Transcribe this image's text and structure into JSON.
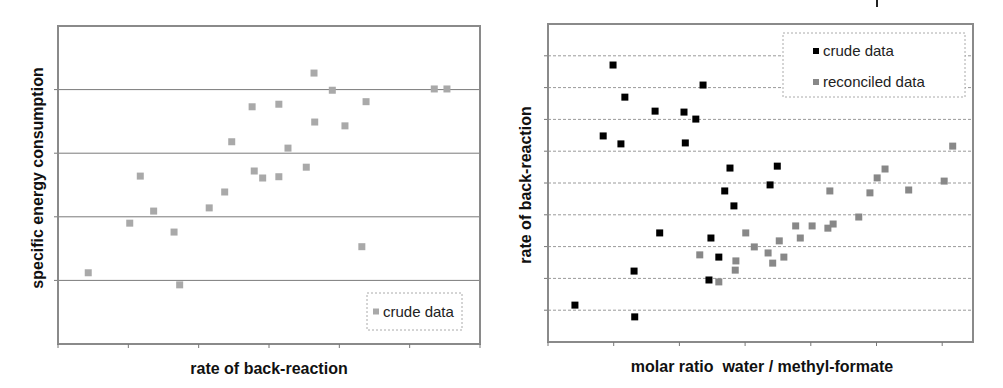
{
  "chart_data": [
    {
      "type": "scatter",
      "title": "",
      "xlabel": "rate of back-reaction",
      "ylabel": "specific energy consumption",
      "xlim": [
        0,
        6
      ],
      "ylim": [
        0,
        5
      ],
      "x_ticks_count": 6,
      "grid": {
        "y": true,
        "y_lines": [
          1,
          2,
          3,
          4
        ],
        "style": "solid"
      },
      "tick_labels_shown": false,
      "legend": {
        "position": "lower right",
        "entries": [
          "crude data"
        ]
      },
      "series": [
        {
          "name": "crude data",
          "color": "#a9a9a9",
          "points": [
            [
              0.43,
              1.12
            ],
            [
              1.02,
              1.9
            ],
            [
              1.17,
              2.64
            ],
            [
              1.36,
              2.09
            ],
            [
              1.65,
              1.76
            ],
            [
              1.73,
              0.93
            ],
            [
              2.15,
              2.14
            ],
            [
              2.37,
              2.39
            ],
            [
              2.47,
              3.18
            ],
            [
              2.76,
              3.73
            ],
            [
              2.79,
              2.72
            ],
            [
              2.91,
              2.61
            ],
            [
              3.14,
              2.63
            ],
            [
              3.14,
              3.77
            ],
            [
              3.27,
              3.08
            ],
            [
              3.53,
              2.78
            ],
            [
              3.64,
              4.26
            ],
            [
              3.65,
              3.49
            ],
            [
              3.9,
              3.99
            ],
            [
              4.08,
              3.43
            ],
            [
              4.38,
              3.81
            ],
            [
              4.32,
              1.53
            ],
            [
              5.35,
              4.01
            ],
            [
              5.53,
              4.01
            ]
          ]
        }
      ]
    },
    {
      "type": "scatter",
      "title": "",
      "xlabel": "molar ratio  water / methyl-formate",
      "ylabel": "rate of back-reaction",
      "xlim": [
        0,
        6.45
      ],
      "ylim": [
        0,
        10
      ],
      "x_ticks_count": 6,
      "grid": {
        "y": true,
        "y_lines": [
          1,
          2,
          3,
          4,
          5,
          6,
          7,
          8,
          9
        ],
        "style": "dashed"
      },
      "tick_labels_shown": false,
      "legend": {
        "position": "upper right",
        "entries": [
          "crude data",
          "reconciled data"
        ]
      },
      "series": [
        {
          "name": "crude data",
          "color": "#000000",
          "points": [
            [
              0.41,
              1.16
            ],
            [
              0.84,
              6.48
            ],
            [
              0.99,
              8.71
            ],
            [
              1.11,
              6.23
            ],
            [
              1.17,
              7.7
            ],
            [
              1.31,
              2.23
            ],
            [
              1.32,
              0.79
            ],
            [
              1.63,
              7.26
            ],
            [
              1.7,
              3.43
            ],
            [
              2.07,
              7.23
            ],
            [
              2.09,
              6.26
            ],
            [
              2.25,
              7.01
            ],
            [
              2.36,
              8.08
            ],
            [
              2.45,
              1.95
            ],
            [
              2.48,
              3.27
            ],
            [
              2.6,
              2.67
            ],
            [
              2.69,
              4.75
            ],
            [
              2.77,
              5.47
            ],
            [
              2.83,
              4.28
            ],
            [
              3.38,
              4.94
            ],
            [
              3.49,
              5.53
            ]
          ]
        },
        {
          "name": "reconciled data",
          "color": "#888888",
          "points": [
            [
              2.31,
              2.74
            ],
            [
              2.6,
              1.89
            ],
            [
              2.85,
              2.26
            ],
            [
              2.86,
              2.55
            ],
            [
              3.01,
              3.43
            ],
            [
              3.14,
              2.99
            ],
            [
              3.35,
              2.8
            ],
            [
              3.42,
              2.48
            ],
            [
              3.52,
              3.18
            ],
            [
              3.59,
              2.67
            ],
            [
              3.77,
              3.65
            ],
            [
              3.84,
              3.27
            ],
            [
              4.02,
              3.65
            ],
            [
              4.26,
              3.58
            ],
            [
              4.29,
              4.75
            ],
            [
              4.34,
              3.71
            ],
            [
              4.73,
              3.93
            ],
            [
              4.9,
              4.69
            ],
            [
              5.01,
              5.16
            ],
            [
              5.13,
              5.44
            ],
            [
              5.49,
              4.78
            ],
            [
              6.03,
              5.06
            ],
            [
              6.16,
              6.16
            ]
          ]
        }
      ]
    }
  ],
  "layout": {
    "left": {
      "plot": {
        "x0": 58,
        "y0": 26,
        "x1": 480,
        "y1": 344
      },
      "legend": {
        "x": 367,
        "y": 293,
        "w": 95,
        "h": 37
      },
      "ylabel_pos": [
        39,
        178
      ],
      "xlabel_pos": [
        269,
        370
      ]
    },
    "right": {
      "plot": {
        "x0": 48,
        "y0": 24,
        "x1": 473,
        "y1": 342
      },
      "x_data_origin_px": 48,
      "x_px_per_unit": 65.7,
      "legend": {
        "x": 283,
        "y": 33,
        "w": 182,
        "h": 64
      },
      "ylabel_pos": [
        27,
        185
      ],
      "xlabel_pos": [
        262,
        368
      ],
      "top_mark_x": 377
    }
  }
}
